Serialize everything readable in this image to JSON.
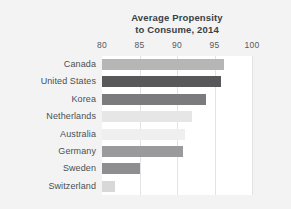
{
  "chart_data": {
    "type": "bar",
    "orientation": "horizontal",
    "title": "Average Propensity to Consume, 2014",
    "title_lines": [
      "Average Propensity",
      "to Consume, 2014"
    ],
    "categories": [
      "Canada",
      "United States",
      "Korea",
      "Netherlands",
      "Australia",
      "Germany",
      "Sweden",
      "Switzerland"
    ],
    "values": [
      96.3,
      95.8,
      93.8,
      92.0,
      91.0,
      90.8,
      85.0,
      81.7
    ],
    "bar_colors": [
      "#b6b6b6",
      "#58585a",
      "#7b7b7d",
      "#e6e6e6",
      "#efefef",
      "#9a9a9c",
      "#8e8e90",
      "#d8d8d8"
    ],
    "xlabel": "",
    "ylabel": "",
    "xlim": [
      80,
      100
    ],
    "xticks": [
      80,
      85,
      90,
      95,
      100
    ],
    "xtick_labels": [
      "80",
      "85",
      "90",
      "95",
      "100"
    ],
    "grid": true,
    "grid_axis": "x",
    "legend": false,
    "panel_background": "#ffffff",
    "figure_background": "#f3f3f3",
    "gridline_color": "#e3e3e3",
    "title_color": "#3a3f44",
    "tick_color": "#55595e",
    "label_color": "#4a4f54"
  }
}
